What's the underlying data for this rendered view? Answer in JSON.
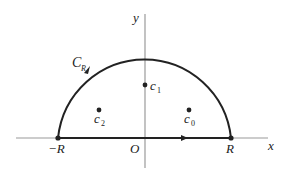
{
  "diagram": {
    "type": "contour-diagram",
    "axes": {
      "x_label": "x",
      "y_label": "y",
      "origin_label": "O"
    },
    "contour": {
      "label_main": "C",
      "label_sub": "R",
      "left_endpoint_label": "−R",
      "right_endpoint_label": "R"
    },
    "points": [
      {
        "id": "c0",
        "label_main": "c",
        "label_sub": "0"
      },
      {
        "id": "c1",
        "label_main": "c",
        "label_sub": "1"
      },
      {
        "id": "c2",
        "label_main": "c",
        "label_sub": "2"
      }
    ],
    "colors": {
      "axis": "#888888",
      "contour": "#222222",
      "text": "#222222"
    }
  }
}
